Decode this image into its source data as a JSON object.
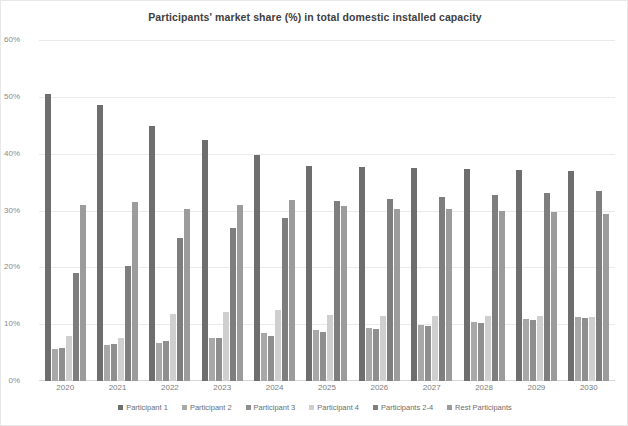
{
  "chart_data": {
    "type": "bar",
    "title": "Participants' market share (%) in total domestic installed capacity",
    "xlabel": "",
    "ylabel": "",
    "ylim": [
      0,
      60
    ],
    "ytick_labels": [
      "0%",
      "10%",
      "20%",
      "30%",
      "40%",
      "50%",
      "60%"
    ],
    "ytick_values": [
      0,
      10,
      20,
      30,
      40,
      50,
      60
    ],
    "grid": true,
    "legend_position": "bottom",
    "categories": [
      "2020",
      "2021",
      "2022",
      "2023",
      "2024",
      "2025",
      "2026",
      "2027",
      "2028",
      "2029",
      "2030"
    ],
    "series": [
      {
        "name": "Participant 1",
        "color": "#6e6e6e",
        "values": [
          50.5,
          48.5,
          44.8,
          42.4,
          39.7,
          37.9,
          37.6,
          37.4,
          37.3,
          37.1,
          36.9
        ]
      },
      {
        "name": "Participant 2",
        "color": "#a8a8a8",
        "values": [
          5.6,
          6.4,
          6.7,
          7.5,
          8.4,
          9.0,
          9.4,
          9.9,
          10.4,
          10.9,
          11.2
        ]
      },
      {
        "name": "Participant 3",
        "color": "#8f8f8f",
        "values": [
          5.8,
          6.6,
          7.0,
          7.5,
          8.0,
          8.6,
          9.2,
          9.7,
          10.2,
          10.7,
          11.1
        ]
      },
      {
        "name": "Participant 4",
        "color": "#cfcfcf",
        "values": [
          7.9,
          7.6,
          11.8,
          12.1,
          12.5,
          11.7,
          11.4,
          11.4,
          11.5,
          11.4,
          11.3
        ]
      },
      {
        "name": "Participants 2-4",
        "color": "#7e7e7e",
        "values": [
          19.0,
          20.3,
          25.2,
          27.0,
          28.7,
          31.6,
          32.0,
          32.4,
          32.7,
          33.1,
          33.5
        ]
      },
      {
        "name": "Rest Participants",
        "color": "#9c9c9c",
        "values": [
          30.9,
          31.5,
          30.3,
          31.0,
          31.9,
          30.8,
          30.3,
          30.2,
          30.0,
          29.7,
          29.4
        ]
      }
    ]
  }
}
